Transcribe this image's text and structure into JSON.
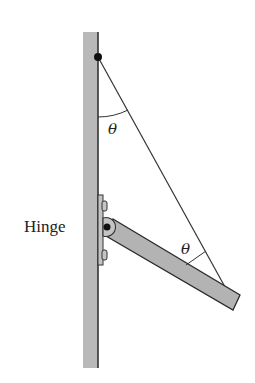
{
  "diagram": {
    "type": "physics-free-body",
    "labels": {
      "hinge": "Hinge",
      "angle_top": "θ",
      "angle_bottom": "θ"
    },
    "colors": {
      "background": "#ffffff",
      "wall_fill": "#b9b9b9",
      "wall_edge": "#333333",
      "boom_fill": "#b3b3b3",
      "boom_edge": "#2a2a2a",
      "cable": "#333333",
      "pin": "#111111",
      "hinge_fill": "#c4c4c4"
    },
    "geometry": {
      "wall": {
        "x": 83,
        "y": 32,
        "width": 15,
        "height": 336
      },
      "cable_anchor": {
        "x": 98,
        "y": 57
      },
      "cable_end": {
        "x": 230,
        "y": 296
      },
      "hinge_pin": {
        "x": 107,
        "y": 227,
        "r": 9
      },
      "boom_corners": [
        [
          113,
          219
        ],
        [
          240,
          295
        ],
        [
          233,
          310
        ],
        [
          106,
          236
        ]
      ],
      "top_angle_arc": {
        "from": [
          98,
          117
        ],
        "to": [
          128,
          110
        ]
      },
      "bottom_angle_arc": {
        "from": [
          186,
          265
        ],
        "to": [
          206,
          251
        ]
      }
    }
  }
}
